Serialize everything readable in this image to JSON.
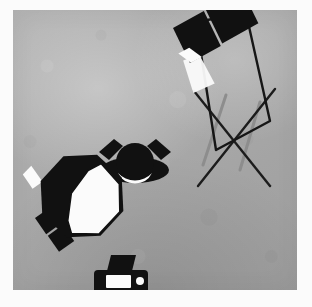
{
  "document": {
    "type": "photography-lighting-setup-diagram",
    "view": "overhead-plan-view",
    "title": "Studio Lighting Setup Diagram",
    "style": "grayscale illustration on textured grey background with white photo border"
  },
  "frame": {
    "border_color": "#fbfbfb",
    "border_left": 13,
    "border_top": 10,
    "border_right": 15,
    "border_bottom": 17
  },
  "canvas": {
    "width": 284,
    "height": 280,
    "background_color": "#a9a9a9",
    "highlight_color": "#bdbdbd",
    "shadow_color": "#9b9b9b"
  },
  "palette": {
    "ink": "#111111",
    "light": "#fbfbfb",
    "beam": "#f7f7f7",
    "stand_line": "#1c1c1c",
    "stand_shadow": "#8a8a8a"
  },
  "elements": [
    {
      "id": "top-flash",
      "name": "speedlight-flash-top",
      "label": "Speedlight flash (hair / background light)",
      "position": {
        "x": 172,
        "y": 18
      },
      "rotation_deg": -15,
      "beam_direction": "down",
      "beam_visible": true
    },
    {
      "id": "subject",
      "name": "model-subject",
      "label": "Model / subject (top-down)",
      "position": {
        "x": 135,
        "y": 158
      },
      "facing": "down-toward-camera"
    },
    {
      "id": "octabox",
      "name": "octabox-softbox-key-light",
      "label": "Octabox softbox key light",
      "position": {
        "x": 82,
        "y": 196
      },
      "rotation_deg": 22,
      "diffusion_panel": "white",
      "aims_at": "subject"
    },
    {
      "id": "octabox-flash",
      "name": "speedlight-flash-octabox",
      "label": "Speedlight flash mounted on octabox",
      "position": {
        "x": 38,
        "y": 225
      },
      "rotation_deg": -22
    },
    {
      "id": "camera",
      "name": "camera",
      "label": "Camera (top-down)",
      "position": {
        "x": 120,
        "y": 278
      },
      "aims_at": "subject"
    },
    {
      "id": "reflector",
      "name": "reflector-panel-with-stand",
      "label": "Reflector / scrim panel on light stand",
      "position": {
        "x": 230,
        "y": 205
      },
      "shape": "parallelogram",
      "stand": "x-brace-legs"
    }
  ],
  "reflector_panel": {
    "name": "reflector-panel",
    "points": "183,12 233,3 257,111 203,140",
    "stroke_width": 2.4
  },
  "stand_legs": [
    {
      "name": "stand-leg-left",
      "x1": 181,
      "y1": 81,
      "x2": 257,
      "y2": 176
    },
    {
      "name": "stand-leg-right",
      "x1": 262,
      "y1": 79,
      "x2": 185,
      "y2": 176
    }
  ],
  "stand_shadows": [
    {
      "name": "stand-leg-shadow-left",
      "x1": 213,
      "y1": 85,
      "x2": 190,
      "y2": 155
    },
    {
      "name": "stand-leg-shadow-right",
      "x1": 247,
      "y1": 92,
      "x2": 227,
      "y2": 160
    }
  ],
  "top_flash": {
    "body": "0,0 34,-9 42,29 8,38",
    "head": "36,-11 76,-21 84,16 44,27",
    "window": "-1,27 9,38 20,35 11,24",
    "beam": "2,34 19,32 26,62 6,66"
  },
  "subject_figure": {
    "shoulders_rx": 34,
    "shoulders_ry": 14,
    "head_r": 19,
    "left_arm": "-34,-7 -22,-21 -10,-17 -24,-3",
    "right_arm": "34,-7 22,-21 10,-17 24,-3",
    "chin": "M -19 9 A 19 19 0 0 0 19 9 A 22 22 0 0 1 -19 9 Z"
  },
  "octabox_shape": {
    "shell": "0,-44 31,-31 44,0 31,31 0,44 -31,31 -44,0 -31,-31",
    "panel": "6,-36 30,-24 40,2 28,29 2,38 -6,28 -12,0 -4,-26",
    "neck": "-44,-2 -58,-12 -63,-2 -50,8"
  },
  "camera_shape": {
    "body": "-26,-6 26,-6 26,16 -26,16",
    "prism": "-10,-22 14,-22 10,-6 -14,-6",
    "lens_outer": "-14,-2 10,-2 10,10 -14,10",
    "lens_inner": "-11,1 7,1 7,7 -11,7",
    "shutter_cx": 19,
    "shutter_cy": 3,
    "shutter_r": 4
  },
  "octabox_flash": {
    "body_a": "0,0 18,-5 23,14 5,19",
    "body_b": "6,21 24,16 29,35 11,40",
    "window": "20,-8 31,-11 34,-2 23,1"
  }
}
